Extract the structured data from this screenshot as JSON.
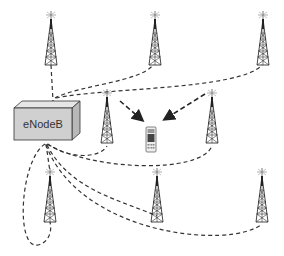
{
  "diagram": {
    "central_node": {
      "label": "eNodeB"
    },
    "towers": [
      {
        "id": "t1",
        "x": 51,
        "y": 15
      },
      {
        "id": "t2",
        "x": 155,
        "y": 15
      },
      {
        "id": "t3",
        "x": 263,
        "y": 15
      },
      {
        "id": "t4",
        "x": 107,
        "y": 90
      },
      {
        "id": "t5",
        "x": 212,
        "y": 90
      },
      {
        "id": "t6",
        "x": 50,
        "y": 170
      },
      {
        "id": "t7",
        "x": 157,
        "y": 170
      },
      {
        "id": "t8",
        "x": 262,
        "y": 170
      }
    ],
    "device": {
      "type": "mobile-phone"
    },
    "links_description": "Dashed links from eNodeB to each tower; two dashed arrows from middle towers to the mobile phone",
    "colors": {
      "line": "#333333",
      "box_front": "#d0d0d0",
      "box_top": "#e6e6e6",
      "box_side": "#b8b8b8"
    }
  }
}
